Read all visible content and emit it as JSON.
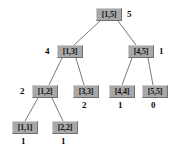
{
  "diagram": {
    "type": "binary-segment-tree",
    "background_color": "#ffffff",
    "node_fill_color": "#a8a8a8",
    "node_text_color": "#141414",
    "edge_color": "#7a7a7a",
    "weight_text_color": "#0b0b0b",
    "nodes": [
      {
        "id": "n-1-5",
        "label": "[1,5]",
        "weight": "5",
        "weight_position": "right",
        "box": {
          "x": 96,
          "y": 8,
          "w": 26,
          "h": 13
        },
        "weight_pos": {
          "x": 127,
          "y": 9
        }
      },
      {
        "id": "n-1-3",
        "label": "[1,3]",
        "weight": "4",
        "weight_position": "left",
        "box": {
          "x": 57,
          "y": 45,
          "w": 26,
          "h": 13
        },
        "weight_pos": {
          "x": 45,
          "y": 46
        }
      },
      {
        "id": "n-4-5",
        "label": "[4,5]",
        "weight": "1",
        "weight_position": "right",
        "box": {
          "x": 128,
          "y": 45,
          "w": 26,
          "h": 13
        },
        "weight_pos": {
          "x": 159,
          "y": 46
        }
      },
      {
        "id": "n-1-2",
        "label": "[1,2]",
        "weight": "2",
        "weight_position": "left",
        "box": {
          "x": 32,
          "y": 85,
          "w": 26,
          "h": 13
        },
        "weight_pos": {
          "x": 20,
          "y": 86
        }
      },
      {
        "id": "n-3-3",
        "label": "[3,3]",
        "weight": "2",
        "weight_position": "below",
        "box": {
          "x": 73,
          "y": 85,
          "w": 26,
          "h": 13
        },
        "weight_pos": {
          "x": 82,
          "y": 100
        }
      },
      {
        "id": "n-4-4",
        "label": "[4,4]",
        "weight": "1",
        "weight_position": "below",
        "box": {
          "x": 109,
          "y": 85,
          "w": 26,
          "h": 13
        },
        "weight_pos": {
          "x": 118,
          "y": 100
        }
      },
      {
        "id": "n-5-5",
        "label": "[5,5]",
        "weight": "0",
        "weight_position": "below",
        "box": {
          "x": 142,
          "y": 85,
          "w": 26,
          "h": 13
        },
        "weight_pos": {
          "x": 151,
          "y": 100
        }
      },
      {
        "id": "n-1-1",
        "label": "[1,1]",
        "weight": "1",
        "weight_position": "below",
        "box": {
          "x": 12,
          "y": 121,
          "w": 26,
          "h": 13
        },
        "weight_pos": {
          "x": 21,
          "y": 136
        }
      },
      {
        "id": "n-2-2",
        "label": "[2,2]",
        "weight": "1",
        "weight_position": "below",
        "box": {
          "x": 52,
          "y": 121,
          "w": 26,
          "h": 13
        },
        "weight_pos": {
          "x": 61,
          "y": 136
        }
      }
    ],
    "edges": [
      {
        "id": "e-root-left",
        "from": "n-1-5",
        "to": "n-1-3",
        "x1": 100,
        "y1": 21,
        "x2": 74,
        "y2": 45
      },
      {
        "id": "e-root-right",
        "from": "n-1-5",
        "to": "n-4-5",
        "x1": 118,
        "y1": 21,
        "x2": 136,
        "y2": 45
      },
      {
        "id": "e-13-left",
        "from": "n-1-3",
        "to": "n-1-2",
        "x1": 62,
        "y1": 58,
        "x2": 49,
        "y2": 85
      },
      {
        "id": "e-13-right",
        "from": "n-1-3",
        "to": "n-3-3",
        "x1": 76,
        "y1": 58,
        "x2": 84,
        "y2": 85
      },
      {
        "id": "e-45-left",
        "from": "n-4-5",
        "to": "n-4-4",
        "x1": 132,
        "y1": 58,
        "x2": 122,
        "y2": 85
      },
      {
        "id": "e-45-right",
        "from": "n-4-5",
        "to": "n-5-5",
        "x1": 148,
        "y1": 58,
        "x2": 153,
        "y2": 85
      },
      {
        "id": "e-12-left",
        "from": "n-1-2",
        "to": "n-1-1",
        "x1": 38,
        "y1": 98,
        "x2": 25,
        "y2": 121
      },
      {
        "id": "e-12-right",
        "from": "n-1-2",
        "to": "n-2-2",
        "x1": 52,
        "y1": 98,
        "x2": 63,
        "y2": 121
      }
    ]
  }
}
